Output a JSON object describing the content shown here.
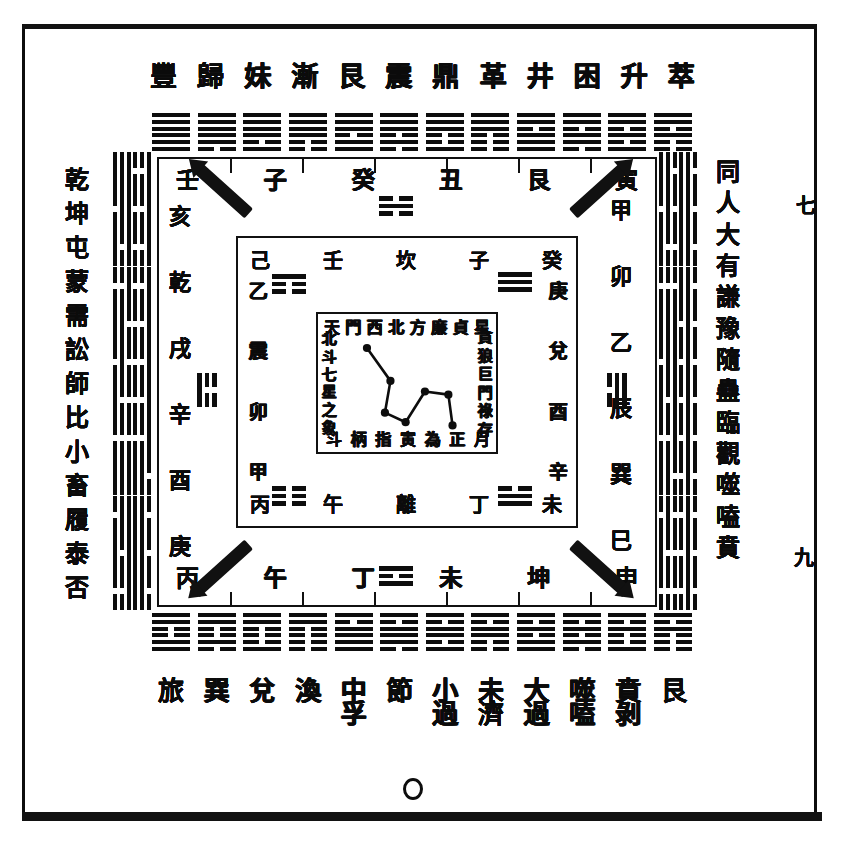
{
  "plate": {
    "title_top_row": [
      "豐",
      "歸",
      "妹",
      "漸",
      "艮",
      "震",
      "鼎",
      "革",
      "井",
      "困",
      "升",
      "萃"
    ],
    "bottom_row_primary": [
      "旅",
      "巽",
      "兌",
      "渙",
      "節",
      "中",
      "孚",
      "小",
      "過",
      "既",
      "濟",
      "未",
      "濟"
    ],
    "bottom_row_as_cells": [
      {
        "main": "旅",
        "second": ""
      },
      {
        "main": "巽",
        "second": ""
      },
      {
        "main": "兌",
        "second": ""
      },
      {
        "main": "渙",
        "second": ""
      },
      {
        "main": "中",
        "second": "孚"
      },
      {
        "main": "節",
        "second": ""
      },
      {
        "main": "小",
        "second": "過"
      },
      {
        "main": "未",
        "second": "濟"
      },
      {
        "main": "大",
        "second": "過"
      },
      {
        "main": "噬",
        "second": "嗑"
      },
      {
        "main": "賁",
        "second": "剝"
      },
      {
        "main": "艮",
        "second": ""
      }
    ],
    "left_column": [
      "乾",
      "坤",
      "屯",
      "蒙",
      "需",
      "訟",
      "師",
      "比",
      "小",
      "畜",
      "履",
      "泰",
      "否"
    ],
    "right_column": [
      "同",
      "人",
      "大",
      "有",
      "謙",
      "豫",
      "隨",
      "蠱",
      "臨",
      "觀",
      "噬",
      "嗑",
      "賁"
    ],
    "right_margin_mark_top": "七",
    "right_margin_mark_bottom": "九",
    "bottom_circle_label": "圓"
  },
  "hexagram_bands": {
    "top": {
      "count": 12,
      "names": [
        "乾",
        "夬",
        "大有",
        "大壯",
        "小畜",
        "需",
        "大畜",
        "泰",
        "履",
        "兌",
        "睽",
        "歸妹"
      ],
      "lines": [
        [
          1,
          1,
          1,
          1,
          1,
          1
        ],
        [
          0,
          1,
          1,
          1,
          1,
          1
        ],
        [
          1,
          0,
          1,
          1,
          1,
          1
        ],
        [
          0,
          0,
          1,
          1,
          1,
          1
        ],
        [
          1,
          1,
          0,
          1,
          1,
          1
        ],
        [
          0,
          1,
          0,
          1,
          1,
          1
        ],
        [
          1,
          0,
          0,
          1,
          1,
          1
        ],
        [
          0,
          0,
          0,
          1,
          1,
          1
        ],
        [
          1,
          1,
          1,
          0,
          1,
          1
        ],
        [
          0,
          1,
          1,
          0,
          1,
          1
        ],
        [
          1,
          0,
          1,
          0,
          1,
          1
        ],
        [
          0,
          0,
          1,
          0,
          1,
          1
        ]
      ]
    },
    "bottom": {
      "count": 12,
      "names": [
        "中孚",
        "節",
        "損",
        "臨",
        "同人",
        "革",
        "離",
        "豐",
        "家人",
        "既濟",
        "賁",
        "明夷"
      ],
      "lines": [
        [
          1,
          1,
          0,
          0,
          1,
          1
        ],
        [
          0,
          1,
          0,
          0,
          1,
          1
        ],
        [
          1,
          0,
          0,
          0,
          1,
          1
        ],
        [
          0,
          0,
          0,
          0,
          1,
          1
        ],
        [
          1,
          1,
          1,
          1,
          0,
          1
        ],
        [
          0,
          1,
          1,
          1,
          0,
          1
        ],
        [
          1,
          0,
          1,
          1,
          0,
          1
        ],
        [
          0,
          0,
          1,
          1,
          0,
          1
        ],
        [
          1,
          1,
          0,
          1,
          0,
          1
        ],
        [
          0,
          1,
          0,
          1,
          0,
          1
        ],
        [
          1,
          0,
          0,
          1,
          0,
          1
        ],
        [
          0,
          0,
          0,
          1,
          0,
          1
        ]
      ]
    },
    "left": {
      "count": 12,
      "names": [
        "無妄",
        "隨",
        "噬嗑",
        "震",
        "益",
        "屯",
        "頤",
        "復",
        "姤",
        "大過",
        "鼎",
        "恆"
      ],
      "lines": [
        [
          1,
          1,
          1,
          0,
          0,
          1
        ],
        [
          0,
          1,
          1,
          0,
          0,
          1
        ],
        [
          1,
          0,
          1,
          0,
          0,
          1
        ],
        [
          0,
          0,
          1,
          0,
          0,
          1
        ],
        [
          1,
          1,
          0,
          0,
          0,
          1
        ],
        [
          0,
          1,
          0,
          0,
          0,
          1
        ],
        [
          1,
          0,
          0,
          0,
          0,
          1
        ],
        [
          0,
          0,
          0,
          0,
          0,
          1
        ],
        [
          1,
          1,
          1,
          1,
          1,
          0
        ],
        [
          0,
          1,
          1,
          1,
          1,
          0
        ],
        [
          1,
          0,
          1,
          1,
          1,
          0
        ],
        [
          0,
          0,
          1,
          1,
          1,
          0
        ]
      ]
    },
    "right": {
      "count": 12,
      "names": [
        "巽",
        "井",
        "蠱",
        "升",
        "訟",
        "困",
        "未濟",
        "解",
        "渙",
        "坎",
        "蒙",
        "師"
      ],
      "lines": [
        [
          1,
          1,
          0,
          1,
          1,
          0
        ],
        [
          0,
          1,
          0,
          1,
          1,
          0
        ],
        [
          1,
          0,
          0,
          1,
          1,
          0
        ],
        [
          0,
          0,
          0,
          1,
          1,
          0
        ],
        [
          1,
          1,
          1,
          0,
          1,
          0
        ],
        [
          0,
          1,
          1,
          0,
          1,
          0
        ],
        [
          1,
          0,
          1,
          0,
          1,
          0
        ],
        [
          0,
          0,
          1,
          0,
          1,
          0
        ],
        [
          1,
          1,
          0,
          0,
          1,
          0
        ],
        [
          0,
          1,
          0,
          0,
          1,
          0
        ],
        [
          1,
          0,
          0,
          0,
          1,
          0
        ],
        [
          0,
          0,
          0,
          0,
          1,
          0
        ]
      ]
    }
  },
  "ring_outer": {
    "top_glyphs": [
      "壬",
      "子",
      "癸",
      "丑",
      "艮",
      "寅"
    ],
    "bottom_glyphs": [
      "丙",
      "午",
      "丁",
      "未",
      "坤",
      "申"
    ],
    "left_glyphs": [
      "亥",
      "乾",
      "戌",
      "辛",
      "酉",
      "庚"
    ],
    "right_glyphs": [
      "甲",
      "卯",
      "乙",
      "辰",
      "巽",
      "巳"
    ],
    "corner_marks": [
      "nw-diagonal",
      "ne-diagonal",
      "sw-diagonal",
      "se-diagonal"
    ]
  },
  "ring_mid": {
    "top_glyphs": [
      "己",
      "壬",
      "坎",
      "子",
      "癸"
    ],
    "bottom_glyphs": [
      "丙",
      "午",
      "離",
      "丁",
      "未"
    ],
    "left_glyphs": [
      "乙",
      "震",
      "卯",
      "甲"
    ],
    "right_glyphs": [
      "庚",
      "兌",
      "酉",
      "辛"
    ],
    "trigrams": [
      {
        "position": "north",
        "name": "坎",
        "lines": [
          0,
          1,
          0
        ]
      },
      {
        "position": "south",
        "name": "離",
        "lines": [
          1,
          0,
          1
        ]
      },
      {
        "position": "west",
        "name": "震",
        "lines": [
          1,
          0,
          0
        ]
      },
      {
        "position": "east",
        "name": "兌",
        "lines": [
          0,
          1,
          1
        ]
      },
      {
        "position": "northwest",
        "name": "艮",
        "lines": [
          0,
          0,
          1
        ]
      },
      {
        "position": "northeast",
        "name": "乾",
        "lines": [
          1,
          1,
          1
        ]
      },
      {
        "position": "southwest",
        "name": "坤",
        "lines": [
          0,
          0,
          0
        ]
      },
      {
        "position": "southeast",
        "name": "巽",
        "lines": [
          1,
          1,
          0
        ]
      }
    ]
  },
  "ring_inner": {
    "top_glyphs": [
      "天",
      "門",
      "西",
      "北",
      "方",
      "廉",
      "貞",
      "星"
    ],
    "bottom_glyphs": [
      "斗",
      "柄",
      "指",
      "寅",
      "為",
      "正",
      "月"
    ],
    "left_glyphs": [
      "北",
      "斗",
      "七",
      "星",
      "之",
      "象"
    ],
    "right_glyphs": [
      "貪",
      "狼",
      "巨",
      "門",
      "祿",
      "存"
    ]
  },
  "chart_data": {
    "type": "scatter",
    "xlabel": "",
    "ylabel": "",
    "points": [
      {
        "name": "天樞 Dubhe",
        "x": 0.21,
        "y": 0.17
      },
      {
        "name": "天璇 Merak",
        "x": 0.38,
        "y": 0.48
      },
      {
        "name": "天璣 Phecda",
        "x": 0.34,
        "y": 0.78
      },
      {
        "name": "天權 Megrez",
        "x": 0.49,
        "y": 0.87
      },
      {
        "name": "玉衡 Alioth",
        "x": 0.63,
        "y": 0.58
      },
      {
        "name": "開陽 Mizar",
        "x": 0.8,
        "y": 0.61
      },
      {
        "name": "搖光 Alkaid",
        "x": 0.83,
        "y": 0.9
      }
    ],
    "connections": [
      [
        0,
        1
      ],
      [
        1,
        2
      ],
      [
        2,
        3
      ],
      [
        3,
        4
      ],
      [
        4,
        5
      ],
      [
        5,
        6
      ]
    ],
    "grid": false,
    "legend": "none"
  },
  "colors": {
    "ink": "#0d0d0d",
    "paper": "#ffffff"
  }
}
